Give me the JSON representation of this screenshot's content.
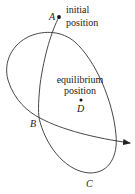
{
  "diagram": {
    "points": {
      "A": {
        "label": "A",
        "note_line1": "initial",
        "note_line2": "position"
      },
      "B": {
        "label": "B"
      },
      "C": {
        "label": "C"
      },
      "D": {
        "label": "D",
        "note_line1": "equilibrium",
        "note_line2": "position"
      }
    },
    "colors": {
      "stroke": "#333333",
      "text": "#1a1a1a",
      "background": "#ffffff"
    }
  }
}
